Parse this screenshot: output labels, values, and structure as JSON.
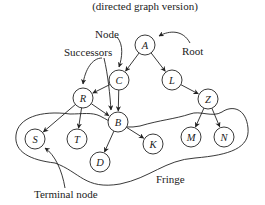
{
  "title": "(directed graph version)",
  "labels": {
    "node": "Node",
    "root": "Root",
    "successors": "Successors",
    "fringe": "Fringe",
    "terminal": "Terminal node"
  },
  "nodes": [
    {
      "id": "A",
      "x": 145,
      "y": 45
    },
    {
      "id": "C",
      "x": 119,
      "y": 80
    },
    {
      "id": "L",
      "x": 172,
      "y": 80
    },
    {
      "id": "R",
      "x": 83,
      "y": 98
    },
    {
      "id": "B",
      "x": 118,
      "y": 122
    },
    {
      "id": "Z",
      "x": 208,
      "y": 99
    },
    {
      "id": "S",
      "x": 35,
      "y": 139
    },
    {
      "id": "T",
      "x": 77,
      "y": 139
    },
    {
      "id": "K",
      "x": 153,
      "y": 144
    },
    {
      "id": "M",
      "x": 191,
      "y": 137
    },
    {
      "id": "N",
      "x": 224,
      "y": 137
    },
    {
      "id": "D",
      "x": 100,
      "y": 162
    }
  ],
  "edges": [
    [
      "A",
      "C"
    ],
    [
      "A",
      "L"
    ],
    [
      "C",
      "R"
    ],
    [
      "C",
      "B"
    ],
    [
      "L",
      "Z"
    ],
    [
      "R",
      "S"
    ],
    [
      "R",
      "T"
    ],
    [
      "R",
      "B"
    ],
    [
      "B",
      "D"
    ],
    [
      "B",
      "K"
    ],
    [
      "Z",
      "M"
    ],
    [
      "Z",
      "N"
    ]
  ]
}
